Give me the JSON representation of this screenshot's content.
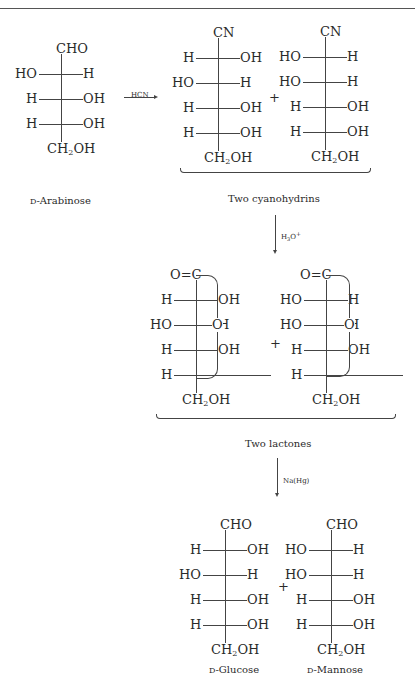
{
  "reaction": "Kiliani-Fischer synthesis",
  "start": {
    "name": "D-Arabinose",
    "top": "CHO",
    "rows": [
      [
        "HO",
        "H"
      ],
      [
        "H",
        "OH"
      ],
      [
        "H",
        "OH"
      ]
    ],
    "bottom": "CH2OH"
  },
  "step1": {
    "reagent": "HCN"
  },
  "cyanohydrins": {
    "label": "Two cyanohydrins",
    "plus": "+",
    "a": {
      "top": "CN",
      "rows": [
        [
          "H",
          "OH"
        ],
        [
          "HO",
          "H"
        ],
        [
          "H",
          "OH"
        ],
        [
          "H",
          "OH"
        ]
      ],
      "bottom": "CH2OH"
    },
    "b": {
      "top": "CN",
      "rows": [
        [
          "HO",
          "H"
        ],
        [
          "HO",
          "H"
        ],
        [
          "H",
          "OH"
        ],
        [
          "H",
          "OH"
        ]
      ],
      "bottom": "CH2OH"
    }
  },
  "step2": {
    "reagent": "H3O+"
  },
  "lactones": {
    "label": "Two lactones",
    "plus": "+",
    "ring_o": "O",
    "a": {
      "top": "O=C",
      "rows": [
        [
          "H",
          "OH"
        ],
        [
          "HO",
          "H"
        ],
        [
          "H",
          "OH"
        ],
        [
          "H",
          ""
        ]
      ],
      "bottom": "CH2OH"
    },
    "b": {
      "top": "O=C",
      "rows": [
        [
          "HO",
          "H"
        ],
        [
          "HO",
          "H"
        ],
        [
          "H",
          "OH"
        ],
        [
          "H",
          ""
        ]
      ],
      "bottom": "CH2OH"
    }
  },
  "step3": {
    "reagent": "Na(Hg)"
  },
  "products": {
    "plus": "+",
    "glucose": {
      "name": "D-Glucose",
      "top": "CHO",
      "rows": [
        [
          "H",
          "OH"
        ],
        [
          "HO",
          "H"
        ],
        [
          "H",
          "OH"
        ],
        [
          "H",
          "OH"
        ]
      ],
      "bottom": "CH2OH"
    },
    "mannose": {
      "name": "D-Mannose",
      "top": "CHO",
      "rows": [
        [
          "HO",
          "H"
        ],
        [
          "HO",
          "H"
        ],
        [
          "H",
          "OH"
        ],
        [
          "H",
          "OH"
        ]
      ],
      "bottom": "CH2OH"
    }
  }
}
